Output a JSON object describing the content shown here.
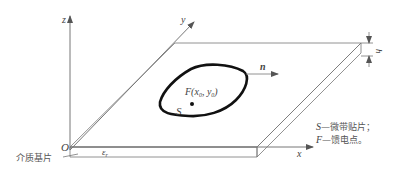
{
  "diagram": {
    "axes": {
      "x_label": "x",
      "y_label": "y",
      "z_label": "z",
      "origin_label": "O"
    },
    "substrate": {
      "label": "介质基片",
      "permittivity_label": "ε",
      "permittivity_subscript": "r",
      "thickness_label": "h"
    },
    "patch": {
      "label": "S",
      "normal_label": "n"
    },
    "feed_point": {
      "label_prefix": "F(x",
      "sub0": "0",
      "mid": ", y",
      "sub1": "0",
      "label_suffix": ")"
    },
    "legend": [
      {
        "symbol": "S",
        "text": "—微带贴片；"
      },
      {
        "symbol": "F",
        "text": "—馈电点。"
      }
    ]
  }
}
